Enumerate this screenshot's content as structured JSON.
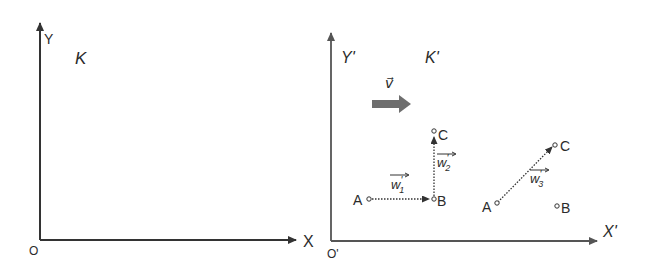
{
  "colors": {
    "ink": "#2b2b2b",
    "axis": "#3a3a3a",
    "axis_primed": "#555555",
    "velocity_arrow": "#6e6e6e",
    "background": "#ffffff"
  },
  "frame_K": {
    "name": "K",
    "x_axis_label": "X",
    "y_axis_label": "Y",
    "origin_label": "O"
  },
  "frame_K_prime": {
    "name": "K'",
    "x_axis_label": "X'",
    "y_axis_label": "Y'",
    "origin_label": "O'",
    "velocity_label": "v⃗",
    "path_via_B": {
      "points": {
        "A": "A",
        "B": "B",
        "C": "C"
      },
      "vectors": [
        {
          "label": "w",
          "subscript": "1",
          "prime": "'",
          "from": "A",
          "to": "B"
        },
        {
          "label": "w",
          "subscript": "2",
          "prime": "'",
          "from": "B",
          "to": "C"
        }
      ]
    },
    "direct_path": {
      "points": {
        "A": "A",
        "B": "B",
        "C": "C"
      },
      "vectors": [
        {
          "label": "w",
          "subscript": "3",
          "prime": "'",
          "from": "A",
          "to": "C"
        }
      ]
    }
  }
}
